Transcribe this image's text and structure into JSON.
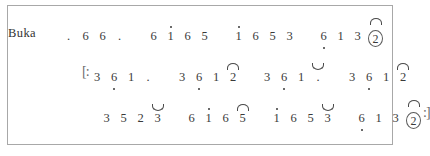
{
  "document": {
    "kind": "kepatihan-cipher-notation",
    "border_color": "#a8a8a8",
    "ink_color": "#3a3a3a",
    "background_color": "#ffffff"
  },
  "rows": [
    {
      "id": "row-buka",
      "label": "Buka",
      "left_repeat": "",
      "right_repeat": "",
      "gatra": [
        {
          "notes": [
            {
              "glyph": ".",
              "octave": "none",
              "accent": "none",
              "circled": false
            },
            {
              "glyph": "6",
              "octave": "none",
              "accent": "none",
              "circled": false
            },
            {
              "glyph": "6",
              "octave": "none",
              "accent": "none",
              "circled": false
            },
            {
              "glyph": ".",
              "octave": "none",
              "accent": "none",
              "circled": false
            }
          ]
        },
        {
          "notes": [
            {
              "glyph": "6",
              "octave": "none",
              "accent": "none",
              "circled": false
            },
            {
              "glyph": "1",
              "octave": "up",
              "accent": "none",
              "circled": false
            },
            {
              "glyph": "6",
              "octave": "none",
              "accent": "none",
              "circled": false
            },
            {
              "glyph": "5",
              "octave": "none",
              "accent": "none",
              "circled": false
            }
          ]
        },
        {
          "notes": [
            {
              "glyph": "1",
              "octave": "up",
              "accent": "none",
              "circled": false
            },
            {
              "glyph": "6",
              "octave": "none",
              "accent": "none",
              "circled": false
            },
            {
              "glyph": "5",
              "octave": "none",
              "accent": "none",
              "circled": false
            },
            {
              "glyph": "3",
              "octave": "none",
              "accent": "none",
              "circled": false
            }
          ]
        },
        {
          "notes": [
            {
              "glyph": "6",
              "octave": "down",
              "accent": "none",
              "circled": false
            },
            {
              "glyph": "1",
              "octave": "none",
              "accent": "none",
              "circled": false
            },
            {
              "glyph": "3",
              "octave": "none",
              "accent": "none",
              "circled": false
            },
            {
              "glyph": "2",
              "octave": "none",
              "accent": "arc",
              "circled": true
            }
          ]
        }
      ]
    },
    {
      "id": "row-two",
      "label": "",
      "left_repeat": "[:",
      "right_repeat": "",
      "gatra": [
        {
          "notes": [
            {
              "glyph": "3",
              "octave": "none",
              "accent": "none",
              "circled": false
            },
            {
              "glyph": "6",
              "octave": "down",
              "accent": "none",
              "circled": false
            },
            {
              "glyph": "1",
              "octave": "none",
              "accent": "none",
              "circled": false
            },
            {
              "glyph": ".",
              "octave": "none",
              "accent": "none",
              "circled": false
            }
          ]
        },
        {
          "notes": [
            {
              "glyph": "3",
              "octave": "none",
              "accent": "none",
              "circled": false
            },
            {
              "glyph": "6",
              "octave": "down",
              "accent": "none",
              "circled": false
            },
            {
              "glyph": "1",
              "octave": "none",
              "accent": "none",
              "circled": false
            },
            {
              "glyph": "2",
              "octave": "none",
              "accent": "arc",
              "circled": false
            }
          ]
        },
        {
          "notes": [
            {
              "glyph": "3",
              "octave": "none",
              "accent": "none",
              "circled": false
            },
            {
              "glyph": "6",
              "octave": "down",
              "accent": "none",
              "circled": false
            },
            {
              "glyph": "1",
              "octave": "none",
              "accent": "none",
              "circled": false
            },
            {
              "glyph": ".",
              "octave": "none",
              "accent": "cup",
              "circled": false
            }
          ]
        },
        {
          "notes": [
            {
              "glyph": "3",
              "octave": "none",
              "accent": "none",
              "circled": false
            },
            {
              "glyph": "6",
              "octave": "down",
              "accent": "none",
              "circled": false
            },
            {
              "glyph": "1",
              "octave": "none",
              "accent": "none",
              "circled": false
            },
            {
              "glyph": "2",
              "octave": "none",
              "accent": "arc",
              "circled": false
            }
          ]
        }
      ]
    },
    {
      "id": "row-three",
      "label": "",
      "left_repeat": "",
      "right_repeat": ":]",
      "gatra": [
        {
          "notes": [
            {
              "glyph": "3",
              "octave": "none",
              "accent": "none",
              "circled": false
            },
            {
              "glyph": "5",
              "octave": "none",
              "accent": "none",
              "circled": false
            },
            {
              "glyph": "2",
              "octave": "none",
              "accent": "none",
              "circled": false
            },
            {
              "glyph": "3",
              "octave": "none",
              "accent": "cup",
              "circled": false
            }
          ]
        },
        {
          "notes": [
            {
              "glyph": "6",
              "octave": "none",
              "accent": "none",
              "circled": false
            },
            {
              "glyph": "1",
              "octave": "up",
              "accent": "none",
              "circled": false
            },
            {
              "glyph": "6",
              "octave": "none",
              "accent": "none",
              "circled": false
            },
            {
              "glyph": "5",
              "octave": "none",
              "accent": "arc",
              "circled": false
            }
          ]
        },
        {
          "notes": [
            {
              "glyph": "1",
              "octave": "up",
              "accent": "none",
              "circled": false
            },
            {
              "glyph": "6",
              "octave": "none",
              "accent": "none",
              "circled": false
            },
            {
              "glyph": "5",
              "octave": "none",
              "accent": "none",
              "circled": false
            },
            {
              "glyph": "3",
              "octave": "none",
              "accent": "cup",
              "circled": false
            }
          ]
        },
        {
          "notes": [
            {
              "glyph": "6",
              "octave": "down",
              "accent": "none",
              "circled": false
            },
            {
              "glyph": "1",
              "octave": "none",
              "accent": "none",
              "circled": false
            },
            {
              "glyph": "3",
              "octave": "none",
              "accent": "none",
              "circled": false
            },
            {
              "glyph": "2",
              "octave": "none",
              "accent": "arc",
              "circled": true
            }
          ]
        }
      ]
    }
  ],
  "layout": {
    "row_label_width_px": 52,
    "row_indent_px": [
      0,
      22,
      38
    ],
    "gatra_gap_px": 17
  }
}
